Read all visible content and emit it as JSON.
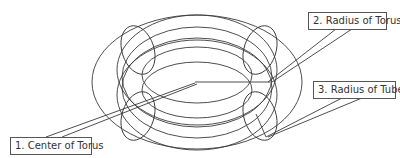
{
  "diagram": {
    "stroke_color": "#3a3a3a",
    "labels": [
      {
        "id": "center",
        "text": "1. Center of Torus"
      },
      {
        "id": "radius-torus",
        "text": "2. Radius of Torus"
      },
      {
        "id": "radius-tube",
        "text": "3. Radius of Tube"
      }
    ]
  }
}
